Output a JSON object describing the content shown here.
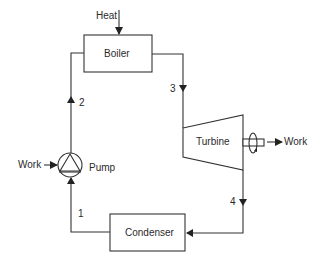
{
  "diagram": {
    "components": {
      "boiler": "Boiler",
      "turbine": "Turbine",
      "condenser": "Condenser",
      "pump": "Pump"
    },
    "flows": {
      "heat_in": "Heat",
      "work_out": "Work",
      "work_in": "Work"
    },
    "states": [
      "1",
      "2",
      "3",
      "4"
    ],
    "colors": {
      "line": "#333333",
      "text": "#2a2a2a",
      "background": "#ffffff"
    }
  }
}
